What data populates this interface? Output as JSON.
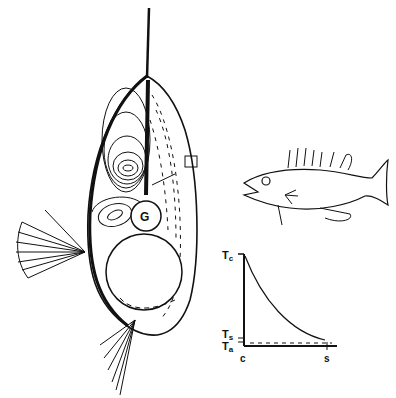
{
  "figure": {
    "cross_section": {
      "center_label": "G"
    },
    "graph": {
      "y_labels": {
        "top": "T",
        "top_sub": "c",
        "mid": "T",
        "mid_sub": "s",
        "low": "T",
        "low_sub": "a"
      },
      "x_labels": {
        "left": "c",
        "right": "s"
      }
    }
  }
}
